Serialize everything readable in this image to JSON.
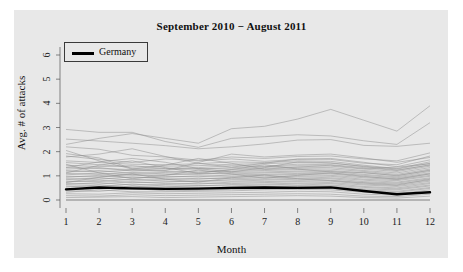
{
  "chart_data": {
    "type": "line",
    "title": "September 2010 − August 2011",
    "xlabel": "Month",
    "ylabel": "Avg. # of attacks",
    "xlim": [
      1,
      12
    ],
    "ylim": [
      0,
      6.4
    ],
    "xticks": [
      "1",
      "2",
      "3",
      "4",
      "5",
      "6",
      "7",
      "8",
      "9",
      "10",
      "11",
      "12"
    ],
    "yticks": [
      "0",
      "1",
      "2",
      "3",
      "4",
      "5",
      "6"
    ],
    "grid": false,
    "legend": {
      "position": "top-left",
      "entries": [
        {
          "name": "Germany",
          "color": "#000000",
          "width": 2.5
        }
      ]
    },
    "x": [
      1,
      2,
      3,
      4,
      5,
      6,
      7,
      8,
      9,
      10,
      11,
      12
    ],
    "highlight_series": {
      "name": "Germany",
      "color": "#000000",
      "values": [
        0.44,
        0.52,
        0.48,
        0.46,
        0.47,
        0.5,
        0.52,
        0.5,
        0.52,
        0.37,
        0.24,
        0.32
      ]
    },
    "background_series": [
      {
        "name": "s01",
        "values": [
          2.3,
          2.55,
          2.75,
          2.55,
          2.35,
          2.95,
          3.05,
          3.35,
          3.75,
          3.3,
          2.85,
          3.9
        ]
      },
      {
        "name": "s02",
        "values": [
          2.92,
          2.8,
          2.8,
          2.42,
          2.18,
          2.55,
          2.62,
          2.7,
          2.65,
          2.45,
          2.3,
          3.2
        ]
      },
      {
        "name": "s03",
        "values": [
          2.52,
          2.44,
          2.35,
          2.25,
          2.12,
          2.2,
          2.32,
          2.48,
          2.5,
          2.26,
          2.22,
          2.35
        ]
      },
      {
        "name": "s04",
        "values": [
          2.2,
          2.1,
          1.85,
          1.78,
          1.65,
          1.78,
          1.72,
          1.8,
          1.82,
          1.7,
          1.62,
          1.95
        ]
      },
      {
        "name": "s05",
        "values": [
          1.78,
          1.9,
          2.12,
          1.8,
          1.52,
          1.36,
          1.52,
          1.7,
          1.68,
          1.52,
          1.46,
          1.82
        ]
      },
      {
        "name": "s06",
        "values": [
          1.82,
          1.68,
          1.55,
          1.7,
          1.62,
          1.7,
          1.6,
          1.68,
          1.72,
          1.56,
          1.38,
          1.66
        ]
      },
      {
        "name": "s07",
        "values": [
          1.62,
          1.55,
          1.48,
          1.46,
          1.5,
          1.58,
          1.55,
          1.62,
          1.6,
          1.44,
          1.3,
          1.58
        ]
      },
      {
        "name": "s08",
        "values": [
          1.55,
          1.46,
          1.36,
          1.4,
          1.42,
          1.48,
          1.5,
          1.55,
          1.52,
          1.4,
          1.28,
          1.52
        ]
      },
      {
        "name": "s09",
        "values": [
          1.44,
          1.38,
          1.42,
          1.3,
          1.34,
          1.42,
          1.4,
          1.48,
          1.46,
          1.34,
          1.22,
          1.46
        ]
      },
      {
        "name": "s10",
        "values": [
          1.36,
          1.3,
          1.26,
          1.32,
          1.28,
          1.34,
          1.38,
          1.42,
          1.4,
          1.28,
          1.18,
          1.4
        ]
      },
      {
        "name": "s11",
        "values": [
          1.28,
          1.34,
          1.2,
          1.24,
          1.3,
          1.28,
          1.32,
          1.36,
          1.34,
          1.22,
          1.12,
          1.34
        ]
      },
      {
        "name": "s12",
        "values": [
          1.22,
          1.16,
          1.24,
          1.18,
          1.14,
          1.24,
          1.26,
          1.3,
          1.28,
          1.18,
          1.06,
          1.28
        ]
      },
      {
        "name": "s13",
        "values": [
          1.16,
          1.22,
          1.1,
          1.14,
          1.2,
          1.18,
          1.22,
          1.26,
          1.22,
          1.12,
          1.02,
          1.22
        ]
      },
      {
        "name": "s14",
        "values": [
          1.1,
          1.06,
          1.14,
          1.08,
          1.06,
          1.14,
          1.16,
          1.2,
          1.18,
          1.06,
          0.96,
          1.18
        ]
      },
      {
        "name": "s15",
        "values": [
          1.04,
          1.12,
          1.02,
          1.04,
          1.1,
          1.08,
          1.12,
          1.16,
          1.12,
          1.02,
          0.92,
          1.12
        ]
      },
      {
        "name": "s16",
        "values": [
          0.98,
          0.96,
          1.06,
          0.98,
          0.96,
          1.04,
          1.06,
          1.1,
          1.08,
          0.96,
          0.88,
          1.08
        ]
      },
      {
        "name": "s17",
        "values": [
          0.94,
          1.02,
          0.92,
          0.94,
          1.0,
          0.98,
          1.02,
          1.06,
          1.02,
          0.92,
          0.84,
          1.02
        ]
      },
      {
        "name": "s18",
        "values": [
          0.88,
          0.86,
          0.96,
          0.88,
          0.86,
          0.94,
          0.96,
          1.0,
          0.98,
          0.86,
          0.8,
          0.98
        ]
      },
      {
        "name": "s19",
        "values": [
          0.84,
          0.92,
          0.82,
          0.84,
          0.9,
          0.88,
          0.92,
          0.96,
          0.92,
          0.82,
          0.74,
          0.92
        ]
      },
      {
        "name": "s20",
        "values": [
          0.78,
          0.76,
          0.86,
          0.78,
          0.76,
          0.84,
          0.86,
          0.9,
          0.88,
          0.76,
          0.7,
          0.88
        ]
      },
      {
        "name": "s21",
        "values": [
          0.74,
          0.82,
          0.72,
          0.74,
          0.8,
          0.78,
          0.82,
          0.86,
          0.82,
          0.72,
          0.66,
          0.82
        ]
      },
      {
        "name": "s22",
        "values": [
          0.68,
          0.66,
          0.76,
          0.68,
          0.66,
          0.74,
          0.76,
          0.8,
          0.78,
          0.66,
          0.6,
          0.78
        ]
      },
      {
        "name": "s23",
        "values": [
          0.64,
          0.72,
          0.62,
          0.64,
          0.7,
          0.68,
          0.72,
          0.76,
          0.72,
          0.62,
          0.56,
          0.72
        ]
      },
      {
        "name": "s24",
        "values": [
          0.58,
          0.56,
          0.66,
          0.58,
          0.58,
          0.64,
          0.66,
          0.7,
          0.68,
          0.56,
          0.5,
          0.68
        ]
      },
      {
        "name": "s25",
        "values": [
          0.54,
          0.62,
          0.54,
          0.54,
          0.6,
          0.58,
          0.62,
          0.66,
          0.62,
          0.52,
          0.46,
          0.62
        ]
      },
      {
        "name": "s26",
        "values": [
          0.48,
          0.46,
          0.58,
          0.48,
          0.48,
          0.54,
          0.56,
          0.6,
          0.58,
          0.46,
          0.42,
          0.58
        ]
      },
      {
        "name": "s27",
        "values": [
          0.42,
          0.52,
          0.44,
          0.44,
          0.5,
          0.48,
          0.52,
          0.56,
          0.52,
          0.42,
          0.36,
          0.52
        ]
      },
      {
        "name": "s28",
        "values": [
          0.38,
          0.36,
          0.48,
          0.38,
          0.4,
          0.44,
          0.46,
          0.5,
          0.48,
          0.36,
          0.32,
          0.48
        ]
      },
      {
        "name": "s29",
        "values": [
          0.32,
          0.42,
          0.34,
          0.34,
          0.36,
          0.38,
          0.42,
          0.44,
          0.42,
          0.32,
          0.26,
          0.42
        ]
      },
      {
        "name": "s30",
        "values": [
          0.26,
          0.24,
          0.3,
          0.26,
          0.28,
          0.3,
          0.32,
          0.36,
          0.34,
          0.24,
          0.2,
          0.34
        ]
      },
      {
        "name": "s31",
        "values": [
          0.18,
          0.16,
          0.22,
          0.18,
          0.2,
          0.22,
          0.24,
          0.26,
          0.24,
          0.16,
          0.14,
          0.24
        ]
      },
      {
        "name": "s32",
        "values": [
          0.1,
          0.12,
          0.14,
          0.1,
          0.12,
          0.14,
          0.16,
          0.18,
          0.16,
          0.1,
          0.08,
          0.16
        ]
      },
      {
        "name": "s33",
        "values": [
          1.92,
          1.74,
          1.3,
          1.22,
          1.55,
          1.9,
          1.78,
          1.86,
          1.9,
          1.74,
          1.56,
          1.76
        ]
      },
      {
        "name": "s34",
        "values": [
          1.34,
          1.58,
          1.72,
          1.56,
          1.3,
          1.16,
          1.34,
          1.58,
          1.54,
          1.38,
          1.24,
          1.44
        ]
      },
      {
        "name": "s35",
        "values": [
          2.05,
          1.62,
          1.28,
          1.44,
          1.72,
          1.52,
          1.28,
          1.36,
          1.44,
          1.3,
          1.36,
          1.5
        ]
      },
      {
        "name": "s36",
        "values": [
          1.12,
          1.44,
          1.62,
          1.34,
          1.1,
          1.26,
          1.46,
          1.28,
          1.16,
          1.14,
          1.0,
          1.24
        ]
      },
      {
        "name": "s37",
        "values": [
          0.72,
          0.94,
          1.08,
          0.86,
          0.74,
          0.92,
          1.04,
          0.88,
          0.8,
          0.7,
          0.62,
          0.86
        ]
      },
      {
        "name": "s38",
        "values": [
          1.48,
          1.12,
          0.88,
          1.02,
          1.24,
          1.08,
          0.9,
          1.02,
          1.12,
          0.98,
          0.86,
          1.08
        ]
      }
    ]
  }
}
